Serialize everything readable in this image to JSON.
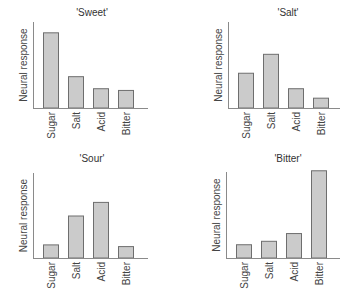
{
  "chart_data": [
    {
      "type": "bar",
      "title": "'Sweet'",
      "xlabel": "",
      "ylabel": "Neural response",
      "categories": [
        "Sugar",
        "Salt",
        "Acid",
        "Bitter"
      ],
      "values": [
        8.8,
        3.7,
        2.3,
        2.1
      ],
      "ylim": [
        0,
        10
      ],
      "grid": false,
      "legend": "none"
    },
    {
      "type": "bar",
      "title": "'Salt'",
      "xlabel": "",
      "ylabel": "Neural response",
      "categories": [
        "Sugar",
        "Salt",
        "Acid",
        "Bitter"
      ],
      "values": [
        4.1,
        6.3,
        2.3,
        1.2
      ],
      "ylim": [
        0,
        10
      ],
      "grid": false,
      "legend": "none"
    },
    {
      "type": "bar",
      "title": "'Sour'",
      "xlabel": "",
      "ylabel": "Neural response",
      "categories": [
        "Sugar",
        "Salt",
        "Acid",
        "Bitter"
      ],
      "values": [
        1.6,
        5.0,
        6.6,
        1.4
      ],
      "ylim": [
        0,
        10
      ],
      "grid": false,
      "legend": "none"
    },
    {
      "type": "bar",
      "title": "'Bitter'",
      "xlabel": "",
      "ylabel": "Neural response",
      "categories": [
        "Sugar",
        "Salt",
        "Acid",
        "Bitter"
      ],
      "values": [
        1.6,
        2.0,
        2.9,
        10.2
      ],
      "ylim": [
        0,
        10
      ],
      "grid": false,
      "legend": "none"
    }
  ],
  "colors": {
    "bar_fill": "#cbcbcb",
    "bar_stroke": "#6e6e6e",
    "axis": "#8a8a8a",
    "text": "#444444"
  }
}
